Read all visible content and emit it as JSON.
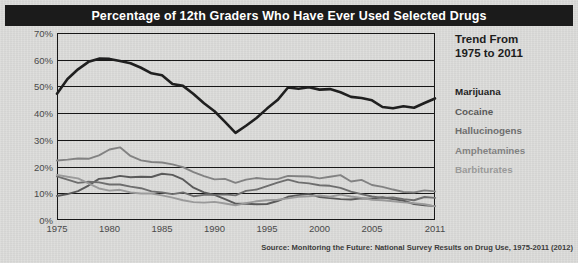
{
  "title": "Percentage of 12th Graders Who Have Ever Used Selected Drugs",
  "legend": {
    "heading_line1": "Trend From",
    "heading_line2": "1975 to 2011",
    "items": [
      {
        "label": "Marijuana",
        "color": "#1f1f1f"
      },
      {
        "label": "Cocaine",
        "color": "#5a5a5a"
      },
      {
        "label": "Hallucinogens",
        "color": "#6e6e6e"
      },
      {
        "label": "Amphetamines",
        "color": "#828282"
      },
      {
        "label": "Barbiturates",
        "color": "#9a9a9a"
      }
    ]
  },
  "source": "Source: Monitoring the Future: National Survey Results on Drug Use, 1975-2011 (2012)",
  "chart_data": {
    "type": "line",
    "title": "Percentage of 12th Graders Who Have Ever Used Selected Drugs",
    "xlabel": "",
    "ylabel": "",
    "xlim": [
      1975,
      2011
    ],
    "ylim": [
      0,
      70
    ],
    "grid": true,
    "legend_position": "right",
    "xticks": [
      1975,
      1980,
      1985,
      1990,
      1995,
      2000,
      2005,
      2011
    ],
    "xtick_labels": [
      "1975",
      "1980",
      "1985",
      "1990",
      "1995",
      "2000",
      "2005",
      "2011"
    ],
    "yticks": [
      0,
      10,
      20,
      30,
      40,
      50,
      60,
      70
    ],
    "ytick_labels": [
      "0%",
      "10%",
      "20%",
      "30%",
      "40%",
      "50%",
      "60%",
      "70%"
    ],
    "x": [
      1975,
      1976,
      1977,
      1978,
      1979,
      1980,
      1981,
      1982,
      1983,
      1984,
      1985,
      1986,
      1987,
      1988,
      1989,
      1990,
      1991,
      1992,
      1993,
      1994,
      1995,
      1996,
      1997,
      1998,
      1999,
      2000,
      2001,
      2002,
      2003,
      2004,
      2005,
      2006,
      2007,
      2008,
      2009,
      2010,
      2011
    ],
    "series": [
      {
        "name": "Marijuana",
        "color": "#1f1f1f",
        "values": [
          47.3,
          52.8,
          56.4,
          59.2,
          60.4,
          60.3,
          59.5,
          58.7,
          57.0,
          54.9,
          54.2,
          50.9,
          50.2,
          47.2,
          43.7,
          40.7,
          36.7,
          32.6,
          35.3,
          38.2,
          41.7,
          44.9,
          49.6,
          49.1,
          49.7,
          48.8,
          49.0,
          47.8,
          46.1,
          45.7,
          44.8,
          42.3,
          41.8,
          42.6,
          42.0,
          43.8,
          45.5
        ]
      },
      {
        "name": "Cocaine",
        "color": "#5a5a5a",
        "values": [
          9.0,
          9.7,
          10.8,
          12.9,
          15.4,
          15.7,
          16.5,
          16.0,
          16.2,
          16.1,
          17.3,
          16.9,
          15.2,
          12.1,
          10.3,
          9.4,
          7.8,
          6.1,
          6.1,
          5.9,
          6.0,
          7.1,
          8.7,
          9.3,
          9.8,
          8.6,
          8.2,
          7.8,
          7.7,
          8.1,
          8.0,
          8.5,
          7.8,
          7.2,
          6.0,
          5.5,
          5.2
        ]
      },
      {
        "name": "Hallucinogens",
        "color": "#6e6e6e",
        "values": [
          16.3,
          15.1,
          13.9,
          14.3,
          14.1,
          13.3,
          13.3,
          12.5,
          11.9,
          10.7,
          10.3,
          9.7,
          10.3,
          8.9,
          9.4,
          9.4,
          9.6,
          9.2,
          10.9,
          11.4,
          12.7,
          14.0,
          15.1,
          14.1,
          13.7,
          13.0,
          12.8,
          12.0,
          10.6,
          9.7,
          8.8,
          8.3,
          8.4,
          7.8,
          7.4,
          8.6,
          8.3
        ]
      },
      {
        "name": "Amphetamines",
        "color": "#828282",
        "values": [
          22.3,
          22.6,
          23.0,
          22.9,
          24.2,
          26.4,
          27.2,
          24.0,
          22.3,
          21.7,
          21.5,
          20.8,
          19.8,
          17.9,
          16.4,
          15.2,
          15.4,
          13.9,
          15.1,
          15.7,
          15.3,
          15.3,
          16.5,
          16.4,
          16.3,
          15.6,
          16.2,
          16.8,
          14.4,
          15.0,
          13.1,
          12.4,
          11.4,
          10.5,
          10.3,
          11.1,
          10.7
        ]
      },
      {
        "name": "Barbiturates",
        "color": "#9a9a9a",
        "values": [
          16.9,
          16.2,
          15.6,
          13.7,
          11.8,
          11.0,
          11.3,
          10.3,
          9.9,
          9.9,
          9.2,
          8.4,
          7.4,
          6.7,
          6.5,
          6.8,
          6.2,
          5.5,
          6.3,
          7.0,
          7.4,
          7.6,
          8.1,
          8.7,
          8.9,
          9.2,
          8.7,
          9.5,
          8.8,
          8.3,
          7.6,
          7.4,
          7.0,
          6.6,
          6.3,
          5.9,
          5.1
        ]
      }
    ]
  }
}
